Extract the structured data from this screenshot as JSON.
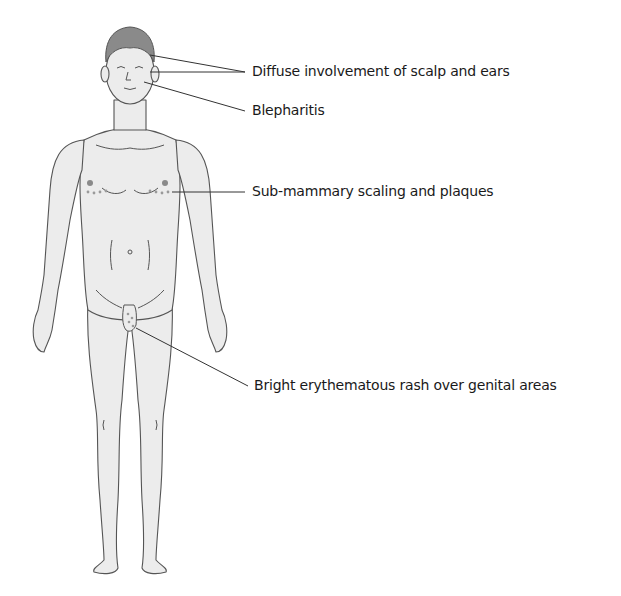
{
  "figure": {
    "skin_color": "#ececec",
    "hair_color": "#8a8a8a",
    "outline_color": "#555555",
    "lesion_dot_color": "#9a9a9a",
    "labels": [
      {
        "id": "scalp",
        "text": "Diffuse involvement of scalp and ears"
      },
      {
        "id": "eyelid",
        "text": "Blepharitis"
      },
      {
        "id": "submammary",
        "text": "Sub-mammary scaling and plaques"
      },
      {
        "id": "genital",
        "text": "Bright erythematous rash over genital areas"
      }
    ]
  }
}
